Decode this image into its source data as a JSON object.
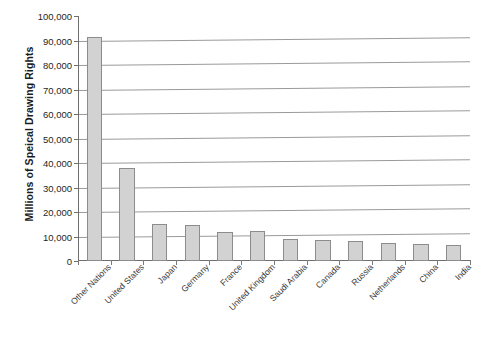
{
  "chart_data": {
    "type": "bar",
    "title": "",
    "subtitle": "",
    "xlabel": "",
    "ylabel": "Millions of Speical Drawing Rights",
    "ylim": [
      0,
      100000
    ],
    "ytick_labels": [
      "100,000",
      "90,000",
      "80,000",
      "70,000",
      "60,000",
      "50,000",
      "40,000",
      "30,000",
      "20,000",
      "10,000",
      "0"
    ],
    "ytick_values": [
      100000,
      90000,
      80000,
      70000,
      60000,
      50000,
      40000,
      30000,
      20000,
      10000,
      0
    ],
    "grid": true,
    "grid_axis": "y",
    "legend": false,
    "legend_position": "none",
    "categories": [
      "Other Nations",
      "United States",
      "Japan",
      "Germany",
      "France",
      "United Kingdom",
      "Saudi Arabia",
      "Canada",
      "Russia",
      "Netherlands",
      "China",
      "India"
    ],
    "values": [
      91500,
      38000,
      15000,
      14800,
      12000,
      12200,
      9000,
      8500,
      8000,
      7500,
      7000,
      6500
    ],
    "bar_color": "#d2d2d2",
    "bar_edge_color": "#8c8c8c",
    "axis_color": "#6f6f6f",
    "gridline_color": "#9a9a9a",
    "background": "#ffffff"
  }
}
